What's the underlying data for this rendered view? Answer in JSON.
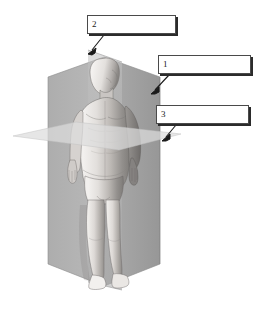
{
  "figure": {
    "background_color": "#ffffff",
    "width": 254,
    "height": 309
  },
  "callouts": [
    {
      "id": "callout-2",
      "number": "2",
      "answer": "",
      "points_to": "sagittal-plane",
      "arrow_from": {
        "x": 103,
        "y": 36
      },
      "arrow_to": {
        "x": 89,
        "y": 52
      }
    },
    {
      "id": "callout-1",
      "number": "1",
      "answer": "",
      "points_to": "coronal-plane",
      "arrow_from": {
        "x": 168,
        "y": 76
      },
      "arrow_to": {
        "x": 152,
        "y": 92
      }
    },
    {
      "id": "callout-3",
      "number": "3",
      "answer": "",
      "points_to": "transverse-plane",
      "arrow_from": {
        "x": 176,
        "y": 126
      },
      "arrow_to": {
        "x": 163,
        "y": 140
      }
    }
  ],
  "planes": [
    {
      "name": "coronal-plane",
      "label": "Coronal / frontal plane",
      "color": "#9d9d9d",
      "orientation": "vertical, divides front from back"
    },
    {
      "name": "sagittal-plane",
      "label": "Sagittal plane",
      "color": "#b5b5b5",
      "orientation": "vertical, divides left from right"
    },
    {
      "name": "transverse-plane",
      "label": "Transverse / horizontal plane",
      "color": "#d6d6d6",
      "orientation": "horizontal, divides upper from lower"
    }
  ],
  "colors": {
    "box_border": "#4a4a4a",
    "box_shadow": "#2b2b2b",
    "arrow": "#1a1a1a",
    "body_light": "#e9e6e3",
    "body_mid": "#b9b5b1",
    "body_dark": "#8d8a87",
    "body_shadow": "#6d6a68",
    "outline": "#5a5755"
  }
}
